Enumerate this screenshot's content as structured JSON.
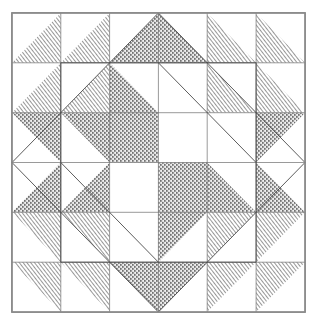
{
  "figure": {
    "kind": "line-art-diagram",
    "canvas": {
      "width": 316,
      "height": 321,
      "background": "#ffffff"
    },
    "border": {
      "name": "outer-block-border",
      "x": 12,
      "y": 13,
      "width": 293,
      "height": 299,
      "stroke": "#8c8c8c",
      "stroke_width": 1.6,
      "fill": "#ffffff"
    },
    "grid": {
      "rows": 6,
      "cols": 6,
      "x_lines": [
        12,
        60.8,
        109.6,
        158.4,
        207.2,
        256.1,
        305
      ],
      "y_lines": [
        13,
        62.8,
        112.7,
        162.5,
        212.3,
        262.2,
        312
      ],
      "stroke": "#6e6e6e",
      "stroke_width": 0.7
    },
    "fabrics": [
      {
        "key": "plain",
        "label": "Background (unshaded)",
        "fill": "#ffffff",
        "texture": "none"
      },
      {
        "key": "hatch",
        "label": "Diagonal-line fabric",
        "fill": "#b4b4b4",
        "texture": "diagonal-hatch"
      },
      {
        "key": "stipple",
        "label": "Stippled-dot fabric",
        "fill": "#9a9a9a",
        "texture": "dot-stipple"
      }
    ],
    "unit_legend": {
      "hst": "half-square-triangle",
      "orientations": [
        "tl",
        "tr",
        "bl",
        "br",
        "full"
      ],
      "note": "orientation names the corner the shaded triangle occupies"
    },
    "cells": [
      {
        "r": 0,
        "c": 0,
        "unit": "hst",
        "orient": "br",
        "fabric": "hatch",
        "name": "unit-r0-c0"
      },
      {
        "r": 0,
        "c": 1,
        "unit": "hst",
        "orient": "br",
        "fabric": "hatch",
        "name": "unit-r0-c1"
      },
      {
        "r": 0,
        "c": 2,
        "unit": "hst",
        "orient": "br",
        "fabric": "stipple",
        "name": "unit-r0-c2"
      },
      {
        "r": 0,
        "c": 3,
        "unit": "hst",
        "orient": "bl",
        "fabric": "stipple",
        "name": "unit-r0-c3"
      },
      {
        "r": 0,
        "c": 4,
        "unit": "hst",
        "orient": "bl",
        "fabric": "hatch",
        "name": "unit-r0-c4"
      },
      {
        "r": 0,
        "c": 5,
        "unit": "hst",
        "orient": "bl",
        "fabric": "hatch",
        "name": "unit-r0-c5"
      },
      {
        "r": 1,
        "c": 0,
        "unit": "hst",
        "orient": "br",
        "fabric": "hatch",
        "name": "unit-r1-c0"
      },
      {
        "r": 1,
        "c": 1,
        "unit": "hst",
        "orient": "br",
        "fabric": "hatch",
        "name": "unit-r1-c1"
      },
      {
        "r": 1,
        "c": 2,
        "unit": "hst",
        "orient": "bl",
        "fabric": "stipple",
        "name": "unit-r1-c2"
      },
      {
        "r": 1,
        "c": 3,
        "unit": "plain",
        "orient": "full",
        "fabric": "plain",
        "name": "unit-r1-c3"
      },
      {
        "r": 1,
        "c": 4,
        "unit": "hst",
        "orient": "bl",
        "fabric": "hatch",
        "name": "unit-r1-c4"
      },
      {
        "r": 1,
        "c": 5,
        "unit": "hst",
        "orient": "bl",
        "fabric": "hatch",
        "name": "unit-r1-c5"
      },
      {
        "r": 2,
        "c": 0,
        "unit": "hst",
        "orient": "tr",
        "fabric": "stipple",
        "name": "unit-r2-c0"
      },
      {
        "r": 2,
        "c": 1,
        "unit": "hst",
        "orient": "tr",
        "fabric": "stipple",
        "name": "unit-r2-c1"
      },
      {
        "r": 2,
        "c": 2,
        "unit": "full",
        "orient": "full",
        "fabric": "stipple",
        "name": "unit-r2-c2"
      },
      {
        "r": 2,
        "c": 3,
        "unit": "plain",
        "orient": "full",
        "fabric": "plain",
        "name": "unit-r2-c3"
      },
      {
        "r": 2,
        "c": 4,
        "unit": "hst",
        "orient": "tr",
        "fabric": "plain",
        "name": "unit-r2-c4"
      },
      {
        "r": 2,
        "c": 5,
        "unit": "hst",
        "orient": "tl",
        "fabric": "stipple",
        "name": "unit-r2-c5"
      },
      {
        "r": 3,
        "c": 0,
        "unit": "hst",
        "orient": "br",
        "fabric": "stipple",
        "name": "unit-r3-c0"
      },
      {
        "r": 3,
        "c": 1,
        "unit": "hst",
        "orient": "br",
        "fabric": "stipple",
        "name": "unit-r3-c1"
      },
      {
        "r": 3,
        "c": 2,
        "unit": "plain",
        "orient": "full",
        "fabric": "plain",
        "name": "unit-r3-c2"
      },
      {
        "r": 3,
        "c": 3,
        "unit": "full",
        "orient": "full",
        "fabric": "stipple",
        "name": "unit-r3-c3"
      },
      {
        "r": 3,
        "c": 4,
        "unit": "hst",
        "orient": "bl",
        "fabric": "stipple",
        "name": "unit-r3-c4"
      },
      {
        "r": 3,
        "c": 5,
        "unit": "hst",
        "orient": "bl",
        "fabric": "stipple",
        "name": "unit-r3-c5"
      },
      {
        "r": 4,
        "c": 0,
        "unit": "hst",
        "orient": "tr",
        "fabric": "hatch",
        "name": "unit-r4-c0"
      },
      {
        "r": 4,
        "c": 1,
        "unit": "hst",
        "orient": "tr",
        "fabric": "hatch",
        "name": "unit-r4-c1"
      },
      {
        "r": 4,
        "c": 2,
        "unit": "plain",
        "orient": "full",
        "fabric": "plain",
        "name": "unit-r4-c2"
      },
      {
        "r": 4,
        "c": 3,
        "unit": "hst",
        "orient": "tl",
        "fabric": "stipple",
        "name": "unit-r4-c3"
      },
      {
        "r": 4,
        "c": 4,
        "unit": "hst",
        "orient": "tl",
        "fabric": "hatch",
        "name": "unit-r4-c4"
      },
      {
        "r": 4,
        "c": 5,
        "unit": "hst",
        "orient": "tl",
        "fabric": "hatch",
        "name": "unit-r4-c5"
      },
      {
        "r": 5,
        "c": 0,
        "unit": "hst",
        "orient": "tr",
        "fabric": "hatch",
        "name": "unit-r5-c0"
      },
      {
        "r": 5,
        "c": 1,
        "unit": "hst",
        "orient": "tr",
        "fabric": "hatch",
        "name": "unit-r5-c1"
      },
      {
        "r": 5,
        "c": 2,
        "unit": "hst",
        "orient": "tr",
        "fabric": "stipple",
        "name": "unit-r5-c2"
      },
      {
        "r": 5,
        "c": 3,
        "unit": "hst",
        "orient": "tl",
        "fabric": "stipple",
        "name": "unit-r5-c3"
      },
      {
        "r": 5,
        "c": 4,
        "unit": "hst",
        "orient": "tl",
        "fabric": "hatch",
        "name": "unit-r5-c4"
      },
      {
        "r": 5,
        "c": 5,
        "unit": "hst",
        "orient": "tl",
        "fabric": "hatch",
        "name": "unit-r5-c5"
      }
    ],
    "overlay_lines": [
      {
        "name": "inner-square-top-left",
        "x1": 60.8,
        "y1": 62.8,
        "x2": 256.1,
        "y2": 62.8
      },
      {
        "name": "inner-square-bottom",
        "x1": 60.8,
        "y1": 262.2,
        "x2": 256.1,
        "y2": 262.2
      },
      {
        "name": "inner-square-left",
        "x1": 60.8,
        "y1": 62.8,
        "x2": 60.8,
        "y2": 262.2
      },
      {
        "name": "inner-square-right",
        "x1": 256.1,
        "y1": 62.8,
        "x2": 256.1,
        "y2": 262.2
      },
      {
        "name": "diamond-edge-ne",
        "x1": 158.4,
        "y1": 13,
        "x2": 305,
        "y2": 162.5
      },
      {
        "name": "diamond-edge-nw",
        "x1": 158.4,
        "y1": 13,
        "x2": 12,
        "y2": 162.5
      },
      {
        "name": "diamond-edge-se",
        "x1": 305,
        "y1": 162.5,
        "x2": 158.4,
        "y2": 312
      },
      {
        "name": "diamond-edge-sw",
        "x1": 12,
        "y1": 162.5,
        "x2": 158.4,
        "y2": 312
      },
      {
        "name": "pinwheel-diag-upper-right",
        "x1": 158.4,
        "y1": 62.8,
        "x2": 256.1,
        "y2": 162.5
      },
      {
        "name": "pinwheel-diag-lower-left",
        "x1": 60.8,
        "y1": 162.5,
        "x2": 158.4,
        "y2": 262.2
      }
    ]
  }
}
